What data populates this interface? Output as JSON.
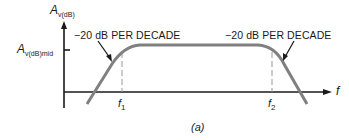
{
  "diagram": {
    "y_axis_label": {
      "main": "A",
      "subscript": "v(dB)"
    },
    "mid_label": {
      "main": "A",
      "subscript": "v(dB)mid"
    },
    "x_axis_label": "f",
    "cutoff_low": {
      "main": "f",
      "subscript": "1"
    },
    "cutoff_high": {
      "main": "f",
      "subscript": "2"
    },
    "rolloff_left": "−20 dB PER DECADE",
    "rolloff_right": "−20 dB PER DECADE",
    "caption": "(a)",
    "colors": {
      "curve": "#808080",
      "axes": "#1a1a1a",
      "dashed": "#999999"
    }
  }
}
